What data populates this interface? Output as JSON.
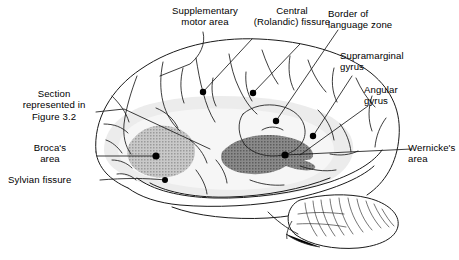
{
  "figure": {
    "title_implicit": "Lateral view of the left cerebral hemisphere showing the language zone",
    "type": "anatomical-diagram",
    "background": "#ffffff",
    "ink": "#1a1a1a",
    "shading": {
      "language_zone_halo": "#ebebeb",
      "brocas_area_fill": "#b4b4b4",
      "wernickes_area_fill": "#7d7d7d"
    }
  },
  "labels": {
    "supplementary_motor_area": "Supplementary\nmotor area",
    "central_rolandic_fissure": "Central\n(Rolandic) fissure",
    "border_of_language_zone": "Border of\nlanguage zone",
    "supramarginal_gyrus": "Supramarginal\ngyrus",
    "angular_gyrus": "Angular\ngyrus",
    "wernickes_area": "Wernicke's\narea",
    "section_represented": "Section\nrepresented in\nFigure 3.2",
    "brocas_area": "Broca's\narea",
    "sylvian_fissure": "Sylvian fissure"
  },
  "markers": [
    {
      "name": "supplementary-motor-area-marker",
      "x": 203,
      "y": 92
    },
    {
      "name": "central-rolandic-fissure-marker",
      "x": 253,
      "y": 93
    },
    {
      "name": "border-of-language-zone-marker",
      "x": 276,
      "y": 121
    },
    {
      "name": "supramarginal-gyrus-marker",
      "x": 313,
      "y": 136
    },
    {
      "name": "angular-gyrus-marker",
      "x": 300,
      "y": 155
    },
    {
      "name": "wernickes-area-marker",
      "x": 285,
      "y": 155
    },
    {
      "name": "brocas-area-marker",
      "x": 156,
      "y": 156
    },
    {
      "name": "sylvian-fissure-marker",
      "x": 165,
      "y": 180
    }
  ],
  "regions": [
    {
      "name": "brocas-area-region",
      "shade": "light",
      "description": "Inferior frontal gyrus, pars opercularis/triangularis"
    },
    {
      "name": "wernickes-area-region",
      "shade": "dark",
      "description": "Posterior superior temporal gyrus"
    },
    {
      "name": "language-zone-halo",
      "shade": "faint",
      "description": "Perisylvian language zone"
    },
    {
      "name": "cerebellum",
      "shade": "none",
      "description": "Folia of the cerebellum"
    }
  ]
}
